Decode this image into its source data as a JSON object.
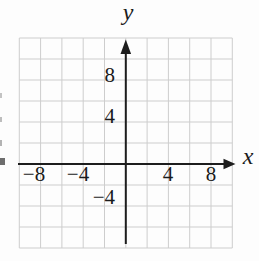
{
  "chart_data": {
    "type": "scatter",
    "title": "",
    "subtitle": "",
    "xlabel": "x",
    "ylabel": "y",
    "xlim": [
      -10,
      10
    ],
    "ylim": [
      -8,
      12
    ],
    "grid": true,
    "grid_step": 2,
    "series": [],
    "x_ticks": [
      {
        "value": -8,
        "label": "−8"
      },
      {
        "value": -4,
        "label": "−4"
      },
      {
        "value": 4,
        "label": "4"
      },
      {
        "value": 8,
        "label": "8"
      }
    ],
    "y_ticks": [
      {
        "value": 8,
        "label": "8"
      },
      {
        "value": 4,
        "label": "4"
      },
      {
        "value": -4,
        "label": "−4"
      }
    ],
    "colors": {
      "grid": "#cdcdcd",
      "axis": "#1d1d1d",
      "text": "#1b1b1b",
      "background": "#fdfdfd"
    }
  }
}
